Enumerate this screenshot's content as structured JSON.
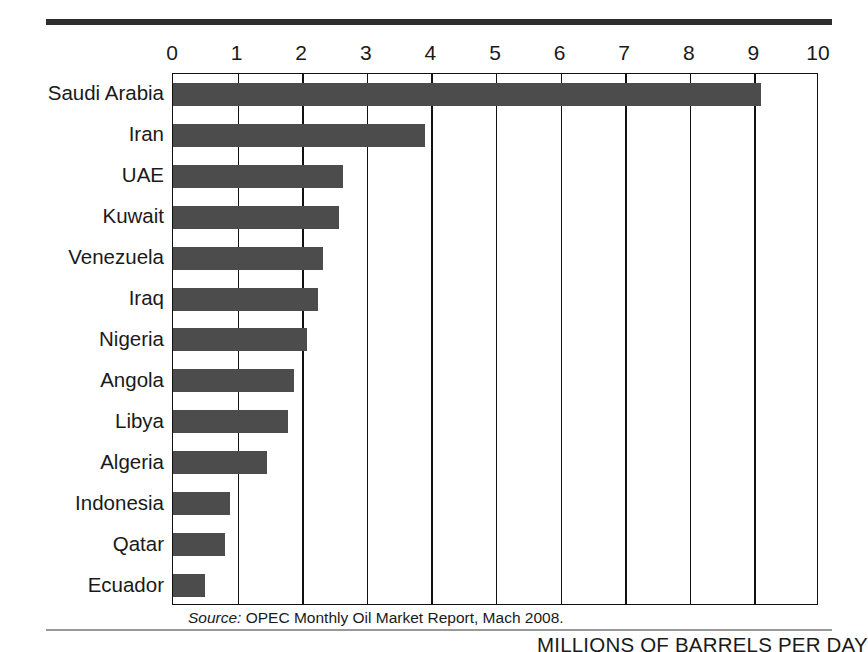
{
  "figure": {
    "annotation": "MILLIONS OF BARRELS PER DAY",
    "source_label": "Source:",
    "source_text": " OPEC Monthly Oil Market Report, Mach 2008.",
    "bar_color": "#4c4c4c",
    "rule_color": "#2e2e2e",
    "grid_color": "#111111",
    "text_color": "#1a1a1a"
  },
  "chart_data": {
    "type": "bar",
    "orientation": "horizontal",
    "title": "",
    "subtitle": "",
    "xlabel": "MILLIONS OF BARRELS PER DAY",
    "ylabel": "",
    "xlim": [
      0,
      10
    ],
    "xticks": [
      "0",
      "1",
      "2",
      "3",
      "4",
      "5",
      "6",
      "7",
      "8",
      "9",
      "10"
    ],
    "grid": true,
    "legend": false,
    "categories": [
      "Saudi Arabia",
      "Iran",
      "UAE",
      "Kuwait",
      "Venezuela",
      "Iraq",
      "Nigeria",
      "Angola",
      "Libya",
      "Algeria",
      "Indonesia",
      "Qatar",
      "Ecuador"
    ],
    "values": [
      9.1,
      3.9,
      2.63,
      2.57,
      2.32,
      2.25,
      2.08,
      1.88,
      1.78,
      1.46,
      0.88,
      0.8,
      0.5
    ],
    "units": "millions of barrels per day",
    "source": "Source: OPEC Monthly Oil Market Report, Mach 2008."
  }
}
